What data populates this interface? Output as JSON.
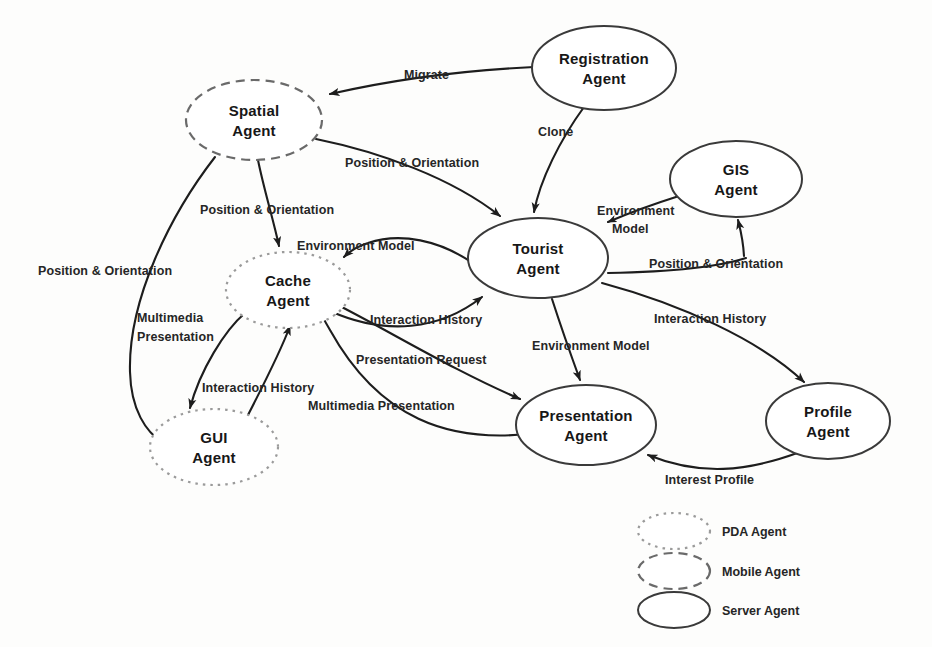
{
  "diagram": {
    "type": "agent-interaction-diagram",
    "background_color": "#fdfdfc",
    "line_color": "#1d1d1d",
    "nodes": [
      {
        "id": "spatial",
        "label_line1": "Spatial",
        "label_line2": "Agent",
        "style": "mobile",
        "cx": 254,
        "cy": 120,
        "rx": 68,
        "ry": 40
      },
      {
        "id": "registration",
        "label_line1": "Registration",
        "label_line2": "Agent",
        "style": "server",
        "cx": 604,
        "cy": 68,
        "rx": 72,
        "ry": 42
      },
      {
        "id": "gis",
        "label_line1": "GIS",
        "label_line2": "Agent",
        "style": "server",
        "cx": 736,
        "cy": 179,
        "rx": 66,
        "ry": 38
      },
      {
        "id": "tourist",
        "label_line1": "Tourist",
        "label_line2": "Agent",
        "style": "server",
        "cx": 538,
        "cy": 258,
        "rx": 70,
        "ry": 40
      },
      {
        "id": "cache",
        "label_line1": "Cache",
        "label_line2": "Agent",
        "style": "pda",
        "cx": 288,
        "cy": 290,
        "rx": 62,
        "ry": 38
      },
      {
        "id": "gui",
        "label_line1": "GUI",
        "label_line2": "Agent",
        "style": "pda",
        "cx": 214,
        "cy": 447,
        "rx": 64,
        "ry": 38
      },
      {
        "id": "presentation",
        "label_line1": "Presentation",
        "label_line2": "Agent",
        "style": "server",
        "cx": 586,
        "cy": 425,
        "rx": 70,
        "ry": 40
      },
      {
        "id": "profile",
        "label_line1": "Profile",
        "label_line2": "Agent",
        "style": "server",
        "cx": 828,
        "cy": 421,
        "rx": 62,
        "ry": 38
      }
    ],
    "edges": [
      {
        "id": "e-migrate",
        "from": "registration",
        "to": "spatial",
        "label": "Migrate"
      },
      {
        "id": "e-clone",
        "from": "registration",
        "to": "tourist",
        "label": "Clone"
      },
      {
        "id": "e-spatial-tourist",
        "from": "spatial",
        "to": "tourist",
        "label": "Position & Orientation"
      },
      {
        "id": "e-spatial-cache",
        "from": "spatial",
        "to": "cache",
        "label": "Position & Orientation"
      },
      {
        "id": "e-spatial-gui",
        "from": "spatial",
        "to": "gui",
        "label": "Position & Orientation"
      },
      {
        "id": "e-tourist-cache",
        "from": "tourist",
        "to": "cache",
        "label": "Environment Model"
      },
      {
        "id": "e-gis-tourist",
        "from": "gis",
        "to": "tourist",
        "label": "Environment Model"
      },
      {
        "id": "e-tourist-gis",
        "from": "tourist",
        "to": "gis",
        "label": "Position & Orientation"
      },
      {
        "id": "e-cache-tourist",
        "from": "cache",
        "to": "tourist",
        "label": "Interaction History"
      },
      {
        "id": "e-tourist-profile",
        "from": "tourist",
        "to": "profile",
        "label": "Interaction History"
      },
      {
        "id": "e-tourist-pres",
        "from": "tourist",
        "to": "presentation",
        "label": "Environment Model"
      },
      {
        "id": "e-cache-pres",
        "from": "cache",
        "to": "presentation",
        "label": "Presentation Request"
      },
      {
        "id": "e-pres-cache",
        "from": "presentation",
        "to": "cache",
        "label": "Multimedia Presentation"
      },
      {
        "id": "e-cache-gui",
        "from": "cache",
        "to": "gui",
        "label": "Multimedia Presentation"
      },
      {
        "id": "e-gui-cache",
        "from": "gui",
        "to": "cache",
        "label": "Interaction History"
      },
      {
        "id": "e-profile-pres",
        "from": "profile",
        "to": "presentation",
        "label": "Interest Profile"
      }
    ],
    "edge_labels": [
      {
        "id": "lbl-migrate",
        "text": "Migrate",
        "x": 404,
        "y": 79,
        "anchor": "start"
      },
      {
        "id": "lbl-clone",
        "text": "Clone",
        "x": 538,
        "y": 136,
        "anchor": "start"
      },
      {
        "id": "lbl-po-spatial-tourist",
        "text": "Position & Orientation",
        "x": 345,
        "y": 167,
        "anchor": "start"
      },
      {
        "id": "lbl-po-spatial-cache",
        "text": "Position & Orientation",
        "x": 200,
        "y": 214,
        "anchor": "start"
      },
      {
        "id": "lbl-po-spatial-gui",
        "text": "Position & Orientation",
        "x": 38,
        "y": 275,
        "anchor": "start"
      },
      {
        "id": "lbl-em-gis-1",
        "text": "Environment",
        "x": 597,
        "y": 215,
        "anchor": "start"
      },
      {
        "id": "lbl-em-gis-2",
        "text": "Model",
        "x": 612,
        "y": 233,
        "anchor": "start"
      },
      {
        "id": "lbl-po-tourist-gis",
        "text": "Position & Orientation",
        "x": 649,
        "y": 268,
        "anchor": "start"
      },
      {
        "id": "lbl-em-tourist-cache",
        "text": "Environment Model",
        "x": 297,
        "y": 250,
        "anchor": "start"
      },
      {
        "id": "lbl-ih-cache-tourist",
        "text": "Interaction History",
        "x": 370,
        "y": 324,
        "anchor": "start"
      },
      {
        "id": "lbl-ih-tourist-profile",
        "text": "Interaction History",
        "x": 654,
        "y": 323,
        "anchor": "start"
      },
      {
        "id": "lbl-em-tourist-pres",
        "text": "Environment Model",
        "x": 532,
        "y": 350,
        "anchor": "start"
      },
      {
        "id": "lbl-pres-req",
        "text": "Presentation Request",
        "x": 356,
        "y": 364,
        "anchor": "start"
      },
      {
        "id": "lbl-mm-cache-gui-1",
        "text": "Multimedia",
        "x": 137,
        "y": 322,
        "anchor": "start"
      },
      {
        "id": "lbl-mm-cache-gui-2",
        "text": "Presentation",
        "x": 137,
        "y": 341,
        "anchor": "start"
      },
      {
        "id": "lbl-ih-gui-cache",
        "text": "Interaction History",
        "x": 202,
        "y": 392,
        "anchor": "start"
      },
      {
        "id": "lbl-mm-pres-cache",
        "text": "Multimedia Presentation",
        "x": 308,
        "y": 410,
        "anchor": "start"
      },
      {
        "id": "lbl-interest-profile",
        "text": "Interest Profile",
        "x": 665,
        "y": 484,
        "anchor": "start"
      }
    ],
    "legend": {
      "items": [
        {
          "id": "legend-pda",
          "label": "PDA Agent",
          "style": "pda",
          "cx": 674,
          "cy": 531,
          "rx": 36,
          "ry": 18
        },
        {
          "id": "legend-mobile",
          "label": "Mobile Agent",
          "style": "mobile",
          "cx": 674,
          "cy": 571,
          "rx": 36,
          "ry": 18
        },
        {
          "id": "legend-server",
          "label": "Server Agent",
          "style": "server",
          "cx": 674,
          "cy": 610,
          "rx": 36,
          "ry": 18
        }
      ],
      "label_x": 722
    }
  }
}
